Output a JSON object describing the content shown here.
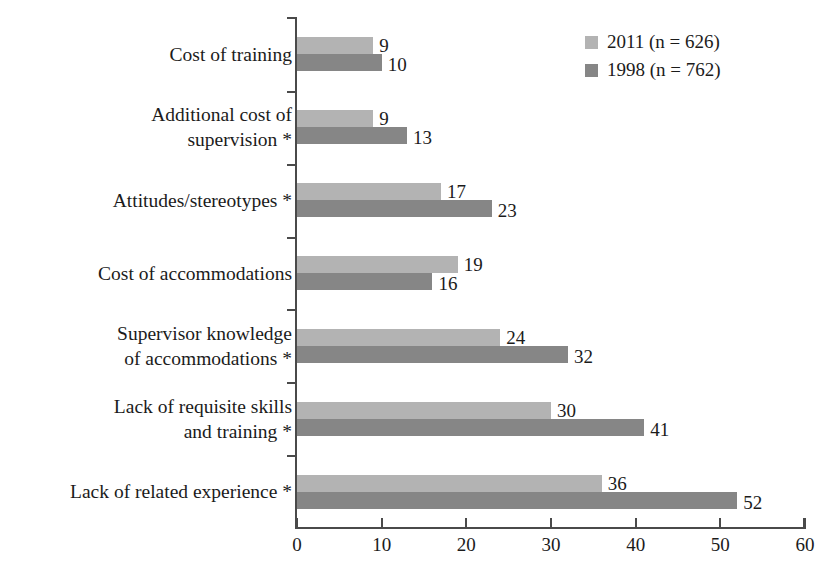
{
  "chart_data": {
    "type": "bar",
    "orientation": "horizontal",
    "title": "",
    "subtitle": "",
    "xlabel": "",
    "ylabel": "",
    "xlim": [
      0,
      60
    ],
    "xticks": [
      0,
      10,
      20,
      30,
      40,
      50,
      60
    ],
    "grid": false,
    "legend_position": "top-right",
    "categories": [
      "Cost of training",
      "Additional cost of\nsupervision *",
      "Attitudes/stereotypes *",
      "Cost of accommodations",
      "Supervisor knowledge\nof accommodations *",
      "Lack of requisite skills\nand training *",
      "Lack of related experience *"
    ],
    "series": [
      {
        "name": "2011 (n = 626)",
        "color": "#b3b3b3",
        "values": [
          9,
          9,
          17,
          19,
          24,
          30,
          36
        ]
      },
      {
        "name": "1998 (n = 762)",
        "color": "#868686",
        "values": [
          10,
          13,
          23,
          16,
          32,
          41,
          52
        ]
      }
    ],
    "annotations": [
      "* indicates statistically significant difference"
    ]
  },
  "legend": {
    "items": [
      {
        "label": "2011 (n = 626)",
        "swatch": "light"
      },
      {
        "label": "1998 (n = 762)",
        "swatch": "dark"
      }
    ]
  },
  "axis": {
    "x_tick_labels": [
      "0",
      "10",
      "20",
      "30",
      "40",
      "50",
      "60"
    ]
  },
  "values_text": {
    "row0": {
      "light": "9",
      "dark": "10"
    },
    "row1": {
      "light": "9",
      "dark": "13"
    },
    "row2": {
      "light": "17",
      "dark": "23"
    },
    "row3": {
      "light": "19",
      "dark": "16"
    },
    "row4": {
      "light": "24",
      "dark": "32"
    },
    "row5": {
      "light": "30",
      "dark": "41"
    },
    "row6": {
      "light": "36",
      "dark": "52"
    }
  }
}
